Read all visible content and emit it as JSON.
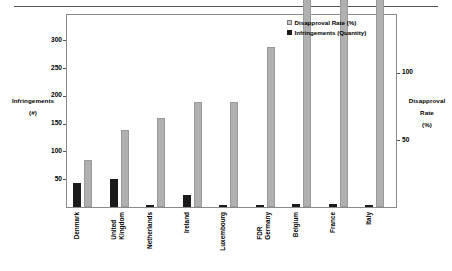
{
  "chart_data": {
    "type": "bar",
    "title": "",
    "subtitle": "",
    "categories": [
      "Denmark",
      "United\nKingdom",
      "Netherlands",
      "Ireland",
      "Luxembourg",
      "FDR\nGermany",
      "Belgium",
      "France",
      "Italy"
    ],
    "series": [
      {
        "name": "Infringements (Quantity)",
        "axis": "left",
        "color": "#1a1a1a",
        "values": [
          35,
          57,
          66,
          78,
          78,
          119,
          182,
          227,
          335
        ]
      },
      {
        "name": "Disapproval Rate (%)",
        "axis": "right",
        "color": "#b0b0b0",
        "values": [
          43,
          50,
          4,
          21,
          3,
          4,
          5,
          6,
          3
        ]
      }
    ],
    "left_axis": {
      "label": "Infringements",
      "unit": "(#)",
      "ticks": [
        50,
        100,
        150,
        200,
        250,
        300
      ],
      "ylim": [
        0,
        345
      ]
    },
    "right_axis": {
      "label": "Disapproval\nRate",
      "unit": "(%)",
      "ticks": [
        50,
        100
      ],
      "ylim": [
        0,
        143
      ]
    },
    "legend": {
      "position": "top-right",
      "entries": [
        {
          "label": "Disapproval Rate (%)",
          "swatch": "light"
        },
        {
          "label": "Infringements (Quantity)",
          "swatch": "dark"
        }
      ]
    },
    "grid": false,
    "xlabel": ""
  },
  "axis_titles": {
    "left_line1": "Infringements",
    "left_line2": "(#)",
    "right_line1": "Disapproval",
    "right_line2": "Rate",
    "right_line3": "(%)"
  },
  "ytick_labels_left": [
    "300",
    "250",
    "200",
    "150",
    "100",
    "50"
  ],
  "ytick_labels_right": [
    "100",
    "50"
  ],
  "xtick_labels": [
    "Denmark",
    "United\nKingdom",
    "Netherlands",
    "Ireland",
    "Luxembourg",
    "FDR\nGermany",
    "Belgium",
    "France",
    "Italy"
  ],
  "legend_labels": [
    "Disapproval Rate (%)",
    "Infringements (Quantity)"
  ]
}
